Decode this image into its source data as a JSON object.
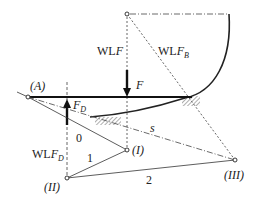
{
  "diagram": {
    "type": "mechanism force-plan / pole diagram",
    "labels": {
      "point_A": "(A)",
      "wl_F": "WL",
      "wl_F_sym": "F",
      "wl_FB": "WL",
      "wl_FB_sym": "F",
      "wl_FB_sub": "B",
      "force_F": "F",
      "force_FD": "F",
      "force_FD_sub": "D",
      "wl_FD": "WL",
      "wl_FD_sym": "F",
      "wl_FD_sub": "D",
      "ray_0": "0",
      "ray_1": "1",
      "ray_2": "2",
      "closing_line_s": "s",
      "pole_I": "(I)",
      "pole_II": "(II)",
      "pole_III": "(III)"
    },
    "colors": {
      "line": "#222222",
      "dotted": "#555555",
      "background": "#ffffff"
    }
  }
}
